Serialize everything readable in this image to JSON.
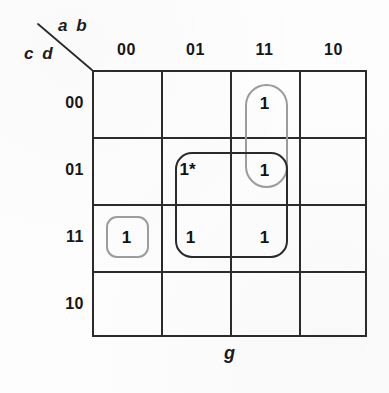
{
  "diagram": {
    "type": "karnaugh-map",
    "function_label": "g",
    "variable_groups": {
      "columns_label": "a b",
      "rows_label": "c d"
    },
    "column_headers": [
      "00",
      "01",
      "11",
      "10"
    ],
    "row_headers": [
      "00",
      "01",
      "11",
      "10"
    ],
    "cells": [
      {
        "row": "00",
        "col": "00",
        "value": ""
      },
      {
        "row": "00",
        "col": "01",
        "value": ""
      },
      {
        "row": "00",
        "col": "11",
        "value": "1"
      },
      {
        "row": "00",
        "col": "10",
        "value": ""
      },
      {
        "row": "01",
        "col": "00",
        "value": ""
      },
      {
        "row": "01",
        "col": "01",
        "value": "1*"
      },
      {
        "row": "01",
        "col": "11",
        "value": "1"
      },
      {
        "row": "01",
        "col": "10",
        "value": ""
      },
      {
        "row": "11",
        "col": "00",
        "value": "1"
      },
      {
        "row": "11",
        "col": "01",
        "value": "1"
      },
      {
        "row": "11",
        "col": "11",
        "value": "1"
      },
      {
        "row": "11",
        "col": "10",
        "value": ""
      },
      {
        "row": "10",
        "col": "00",
        "value": ""
      },
      {
        "row": "10",
        "col": "01",
        "value": ""
      },
      {
        "row": "10",
        "col": "11",
        "value": ""
      },
      {
        "row": "10",
        "col": "10",
        "value": ""
      }
    ],
    "groups": [
      {
        "name": "group-column11-rows00-01",
        "style": "gray",
        "shape": "vertical-pill",
        "covers_columns": [
          "11"
        ],
        "covers_rows": [
          "00",
          "01"
        ]
      },
      {
        "name": "group-column00-row11",
        "style": "gray",
        "shape": "rounded-square",
        "covers_columns": [
          "00"
        ],
        "covers_rows": [
          "11"
        ]
      },
      {
        "name": "group-columns01-11-rows01-11",
        "style": "dark",
        "shape": "rounded-square-2x2",
        "covers_columns": [
          "01",
          "11"
        ],
        "covers_rows": [
          "01",
          "11"
        ]
      }
    ]
  },
  "colors": {
    "grid_line": "#2b2b2b",
    "group_gray": "#9c9c9c",
    "group_dark": "#2a2a2a",
    "text": "#111111",
    "background": "#fdfdfd"
  }
}
